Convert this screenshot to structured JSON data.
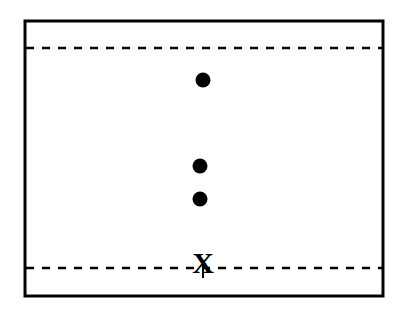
{
  "diagram": {
    "type": "schematic",
    "colors": {
      "stroke": "#000000",
      "background": "#ffffff",
      "dot_fill": "#000000"
    },
    "boundaries": [
      {
        "id": "upper",
        "style": "dashed"
      },
      {
        "id": "lower",
        "style": "dashed"
      }
    ],
    "dots": [
      {
        "id": "dot-1"
      },
      {
        "id": "dot-2"
      },
      {
        "id": "dot-3"
      }
    ],
    "marker": {
      "label": "X",
      "on_boundary": "lower"
    }
  }
}
